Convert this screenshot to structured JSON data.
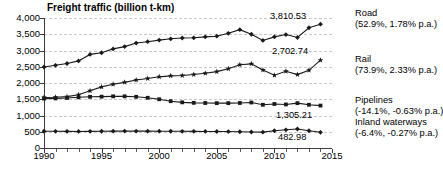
{
  "chart_data": {
    "type": "line",
    "title": "Freight traffic (billion t-km)",
    "xlabel": "",
    "ylabel": "",
    "xlim": [
      1990,
      2015
    ],
    "ylim": [
      0,
      4000
    ],
    "ytick_step": 500,
    "grid": true,
    "legend_position": "right",
    "ytick_labels": [
      "0",
      "500",
      "1,000",
      "1,500",
      "2,000",
      "2,500",
      "3,000",
      "3,500",
      "4,000"
    ],
    "ytick_values": [
      0,
      500,
      1000,
      1500,
      2000,
      2500,
      3000,
      3500,
      4000
    ],
    "xtick_labels": [
      "1990",
      "1995",
      "2000",
      "2005",
      "2010",
      "2015"
    ],
    "xtick_values": [
      1990,
      1995,
      2000,
      2005,
      2010,
      2015
    ],
    "x": [
      1990,
      1991,
      1992,
      1993,
      1994,
      1995,
      1996,
      1997,
      1998,
      1999,
      2000,
      2001,
      2002,
      2003,
      2004,
      2005,
      2006,
      2007,
      2008,
      2009,
      2010,
      2011,
      2012,
      2013,
      2014
    ],
    "series": [
      {
        "name": "Road",
        "legend_label": "Road",
        "legend_sub": "(52.9%, 1.78% p.a.)",
        "end_value_label": "3,810.53",
        "end_value": 3810.53,
        "share_percent": 52.9,
        "growth_pa_percent": 1.78,
        "marker": "diamond",
        "values": [
          2492,
          2545,
          2600,
          2680,
          2880,
          2930,
          3050,
          3120,
          3230,
          3270,
          3320,
          3360,
          3385,
          3390,
          3420,
          3440,
          3530,
          3640,
          3500,
          3310,
          3420,
          3490,
          3400,
          3700,
          3810.53
        ]
      },
      {
        "name": "Rail",
        "legend_label": "Rail",
        "legend_sub": "(73.9%, 2.33% p.a.)",
        "end_value_label": "2,702.74",
        "end_value": 2702.74,
        "share_percent": 73.9,
        "growth_pa_percent": 2.33,
        "marker": "star",
        "values": [
          1554,
          1560,
          1580,
          1640,
          1760,
          1880,
          1960,
          2020,
          2090,
          2140,
          2190,
          2220,
          2230,
          2260,
          2300,
          2350,
          2440,
          2560,
          2590,
          2400,
          2240,
          2360,
          2260,
          2390,
          2702.74
        ]
      },
      {
        "name": "Pipelines",
        "legend_label": "Pipelines",
        "legend_sub": "(-14.1%, -0.63% p.a.)",
        "end_value_label": "1,305.21",
        "end_value": 1305.21,
        "share_percent": -14.1,
        "growth_pa_percent": -0.63,
        "marker": "square",
        "values": [
          1520,
          1525,
          1540,
          1560,
          1575,
          1580,
          1590,
          1590,
          1575,
          1545,
          1500,
          1440,
          1405,
          1390,
          1385,
          1380,
          1380,
          1385,
          1400,
          1330,
          1355,
          1340,
          1380,
          1330,
          1305.21
        ]
      },
      {
        "name": "Inland waterways",
        "legend_label": "Inland waterways",
        "legend_sub": "(-6.4%, -0.27% p.a.)",
        "end_value_label": "482.98",
        "end_value": 482.98,
        "share_percent": -6.4,
        "growth_pa_percent": -0.27,
        "marker": "diamond",
        "values": [
          516,
          514,
          512,
          510,
          512,
          515,
          518,
          520,
          519,
          518,
          517,
          516,
          514,
          512,
          510,
          508,
          506,
          500,
          492,
          487,
          530,
          560,
          585,
          530,
          482.98
        ]
      }
    ]
  }
}
